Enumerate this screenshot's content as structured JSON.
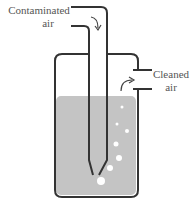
{
  "labels": {
    "inlet_line1": "Contaminated",
    "inlet_line2": "air",
    "outlet_line1": "Cleaned",
    "outlet_line2": "air"
  },
  "colors": {
    "outline": "#333333",
    "liquid": "#c4c4c4",
    "bubble": "#ffffff",
    "text": "#555555"
  }
}
